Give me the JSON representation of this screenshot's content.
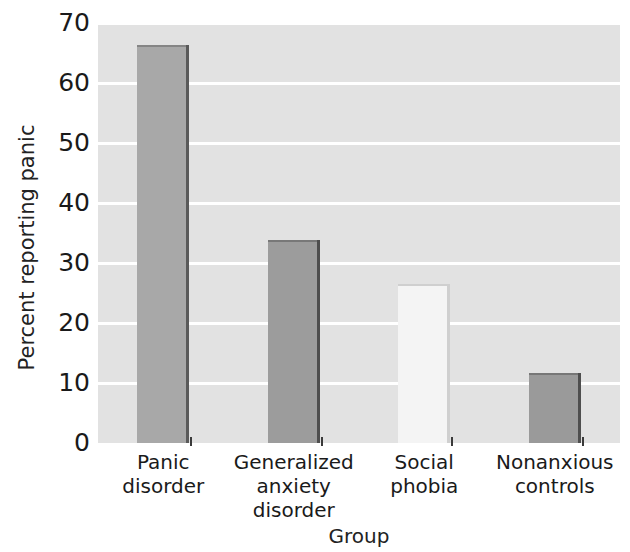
{
  "chart_data": {
    "type": "bar",
    "title": "",
    "subtitle": "",
    "xlabel": "Group",
    "ylabel": "Percent reporting panic",
    "categories": [
      "Panic\ndisorder",
      "Generalized\nanxiety\ndisorder",
      "Social\nphobia",
      "Nonanxious\ncontrols"
    ],
    "category_lines": [
      [
        "Panic",
        "disorder"
      ],
      [
        "Generalized",
        "anxiety",
        "disorder"
      ],
      [
        "Social",
        "phobia"
      ],
      [
        "Nonanxious",
        "controls"
      ]
    ],
    "values": [
      66.3,
      33.8,
      26.5,
      11.7
    ],
    "bar_colors": [
      "#a8a8a8",
      "#9c9c9c",
      "#f4f4f4",
      "#9a9a9a"
    ],
    "bar_edge_colors": [
      "#5a5a5a",
      "#4e4e4e",
      "#cfcfcf",
      "#4e4e4e"
    ],
    "ylim": [
      0,
      70
    ],
    "yticks": [
      0,
      10,
      20,
      30,
      40,
      50,
      60,
      70
    ],
    "ytick_labels": [
      "0",
      "10",
      "20",
      "30",
      "40",
      "50",
      "60",
      "70"
    ],
    "xlim": [
      0,
      4
    ],
    "grid": true,
    "grid_axis": "y",
    "grid_color": "#ffffff",
    "plot_background": "#e2e2e2",
    "figure_background": "#ffffff",
    "legend": null,
    "annotations": []
  }
}
